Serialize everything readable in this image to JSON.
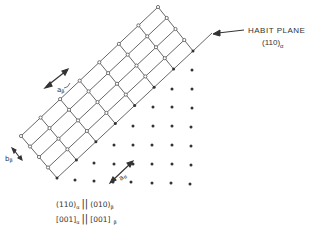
{
  "diagram": {
    "habit_plane": {
      "title": "HABIT PLANE",
      "index": "(110)",
      "subscript": "α"
    },
    "labels": {
      "a_beta": "a",
      "a_beta_sub": "β",
      "b_beta": "b",
      "b_beta_sub": "β",
      "a_alpha": "a",
      "a_alpha_sub": "α"
    },
    "relations": [
      {
        "left": "(110)",
        "left_sub": "α",
        "sep": "||",
        "right": "(010)",
        "right_sub": "β"
      },
      {
        "left": "[001]",
        "left_sub": "α",
        "sep": "||",
        "right": "[001]",
        "right_sub": "β"
      }
    ],
    "colors": {
      "line": "#555555",
      "dot": "#333333",
      "open_node_fill": "#ffffff"
    }
  }
}
